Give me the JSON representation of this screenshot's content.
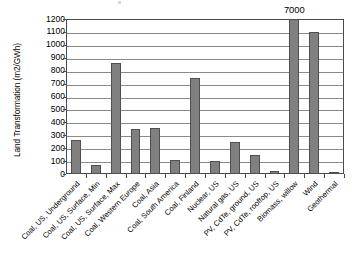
{
  "chart_data": {
    "type": "bar",
    "title": "",
    "xlabel": "",
    "ylabel": "Land Transformation (m2/GWh)",
    "ylim": [
      0,
      1200
    ],
    "ytick_step": 100,
    "grid": true,
    "legend": false,
    "bar_color": "#808080",
    "bar_border_color": "#4f4f4f",
    "categories": [
      "Coal, US, Underground",
      "Coal, US, Surface, Min",
      "Coal, US, Surface, Max",
      "Coal, Western Europe",
      "Coal, Asia",
      "Coal, South America",
      "Coal, Finland",
      "Nuclear, US",
      "Natural gas, US",
      "PV, CdTe, ground, US",
      "PV, CdTe, rooftop, US",
      "Biomass, willow",
      "Wind",
      "Geothermal"
    ],
    "values": [
      260,
      70,
      860,
      345,
      355,
      110,
      745,
      100,
      250,
      150,
      20,
      7000,
      1100,
      8
    ],
    "yticks": [
      0,
      100,
      200,
      300,
      400,
      500,
      600,
      700,
      800,
      900,
      1000,
      1100,
      1200
    ],
    "ytick_labels": [
      "0",
      "100",
      "200",
      "300",
      "400",
      "500",
      "600",
      "700",
      "800",
      "900",
      "1000",
      "1100",
      "1200"
    ],
    "annotations": [
      {
        "text": "7000",
        "category": "Biomass, willow",
        "note": "value exceeds axis maximum; bar clipped at 1200"
      }
    ]
  }
}
